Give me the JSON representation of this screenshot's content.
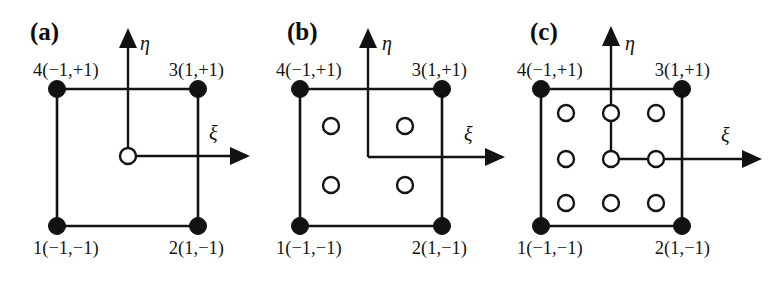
{
  "figure": {
    "kind": "finite-element-reference-square-gauss-points",
    "background_color": "#ffffff",
    "ink_color": "#121212",
    "node_fill_color": "#121212",
    "gauss_fill_color": "#ffffff"
  },
  "axis_labels": {
    "horizontal": "ξ",
    "vertical": "η"
  },
  "corner_labels": {
    "n1": "1(−1,−1)",
    "n2": "2(1,−1)",
    "n3": "3(1,+1)",
    "n4": "4(−1,+1)"
  },
  "panels": [
    {
      "id": "a",
      "tag": "(a)",
      "tag_x": 30,
      "tag_y": 40,
      "square": {
        "left": 57,
        "right": 198,
        "top": 89,
        "bottom": 226
      },
      "origin": {
        "x": 128,
        "y": 156
      },
      "eta_axis": {
        "x": 128,
        "y_top": 42,
        "y_bottom": 156
      },
      "xi_axis": {
        "y": 156,
        "x_left": 128,
        "x_right": 236
      },
      "eta_label": {
        "x": 140,
        "y": 50
      },
      "xi_label": {
        "x": 209,
        "y": 140
      },
      "corner_label_positions": {
        "n4": {
          "x": 33,
          "y": 76,
          "anchor": "start"
        },
        "n3": {
          "x": 224,
          "y": 76,
          "anchor": "end"
        },
        "n1": {
          "x": 33,
          "y": 254,
          "anchor": "start"
        },
        "n2": {
          "x": 224,
          "y": 254,
          "anchor": "end"
        }
      },
      "node_radius": 8.5,
      "gauss_radius": 8.0,
      "gauss_points": [
        {
          "x": 128,
          "y": 156
        }
      ],
      "gauss_point_count": 1,
      "scheme": "1 x 1 Gauss quadrature",
      "connectors": []
    },
    {
      "id": "b",
      "tag": "(b)",
      "tag_x": 32,
      "tag_y": 40,
      "square": {
        "left": 45,
        "right": 187,
        "top": 89,
        "bottom": 226
      },
      "origin": {
        "x": 113,
        "y": 157
      },
      "eta_axis": {
        "x": 113,
        "y_top": 42,
        "y_bottom": 157
      },
      "xi_axis": {
        "y": 157,
        "x_left": 113,
        "x_right": 236
      },
      "eta_label": {
        "x": 127,
        "y": 50
      },
      "xi_label": {
        "x": 209,
        "y": 141
      },
      "corner_label_positions": {
        "n4": {
          "x": 21,
          "y": 76,
          "anchor": "start"
        },
        "n3": {
          "x": 212,
          "y": 76,
          "anchor": "end"
        },
        "n1": {
          "x": 21,
          "y": 254,
          "anchor": "start"
        },
        "n2": {
          "x": 212,
          "y": 254,
          "anchor": "end"
        }
      },
      "node_radius": 8.5,
      "gauss_radius": 8.0,
      "gauss_points": [
        {
          "x": 76,
          "y": 126
        },
        {
          "x": 150,
          "y": 126
        },
        {
          "x": 76,
          "y": 185
        },
        {
          "x": 150,
          "y": 185
        }
      ],
      "gauss_point_count": 4,
      "scheme": "2 x 2 Gauss quadrature",
      "connectors": []
    },
    {
      "id": "c",
      "tag": "(c)",
      "tag_x": 18,
      "tag_y": 40,
      "square": {
        "left": 29,
        "right": 170,
        "top": 89,
        "bottom": 226
      },
      "origin": {
        "x": 99,
        "y": 159
      },
      "eta_axis": {
        "x": 99,
        "y_top": 40,
        "y_bottom": 113
      },
      "xi_axis": {
        "y": 159,
        "x_left": 99,
        "x_right": 236
      },
      "eta_label": {
        "x": 113,
        "y": 50
      },
      "xi_label": {
        "x": 209,
        "y": 142
      },
      "corner_label_positions": {
        "n4": {
          "x": 5,
          "y": 76,
          "anchor": "start"
        },
        "n3": {
          "x": 198,
          "y": 76,
          "anchor": "end"
        },
        "n1": {
          "x": 5,
          "y": 254,
          "anchor": "start"
        },
        "n2": {
          "x": 198,
          "y": 254,
          "anchor": "end"
        }
      },
      "node_radius": 8.5,
      "gauss_radius": 8.0,
      "gauss_points": [
        {
          "x": 54,
          "y": 113
        },
        {
          "x": 99,
          "y": 113
        },
        {
          "x": 144,
          "y": 113
        },
        {
          "x": 54,
          "y": 159
        },
        {
          "x": 99,
          "y": 159
        },
        {
          "x": 144,
          "y": 159
        },
        {
          "x": 54,
          "y": 203
        },
        {
          "x": 99,
          "y": 203
        },
        {
          "x": 144,
          "y": 203
        }
      ],
      "gauss_point_count": 9,
      "scheme": "3 x 3 Gauss quadrature",
      "connectors": [
        {
          "x1": 99,
          "y1": 113,
          "x2": 99,
          "y2": 159
        }
      ]
    }
  ]
}
